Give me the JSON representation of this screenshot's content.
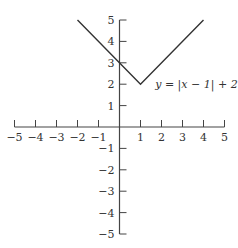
{
  "chart_data": {
    "type": "line",
    "title": "",
    "xlabel": "",
    "ylabel": "",
    "xlim": [
      -5,
      5
    ],
    "ylim": [
      -5,
      5
    ],
    "grid": false,
    "x_ticks": [
      -5,
      -4,
      -3,
      -2,
      -1,
      1,
      2,
      3,
      4,
      5
    ],
    "y_ticks": [
      -5,
      -4,
      -3,
      -2,
      -1,
      1,
      2,
      3,
      4,
      5
    ],
    "x_tick_labels": [
      "−5",
      "−4",
      "−3",
      "−2",
      "−1",
      "1",
      "2",
      "3",
      "4",
      "5"
    ],
    "y_tick_labels": [
      "−5",
      "−4",
      "−3",
      "−2",
      "−1",
      "1",
      "2",
      "3",
      "4",
      "5"
    ],
    "series": [
      {
        "name": "y = |x − 1| + 2",
        "x": [
          -2,
          1,
          4
        ],
        "y": [
          5,
          2,
          5
        ]
      }
    ],
    "annotations": [
      {
        "text": "y = |x − 1| + 2",
        "x": 1.7,
        "y": 2
      }
    ]
  }
}
